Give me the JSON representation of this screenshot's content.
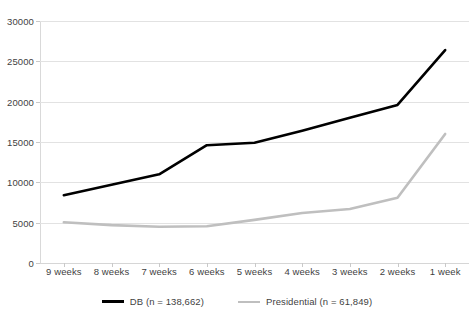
{
  "chart_data": {
    "type": "line",
    "title": "",
    "xlabel": "",
    "ylabel": "",
    "categories": [
      "9 weeks",
      "8 weeks",
      "7 weeks",
      "6 weeks",
      "5 weeks",
      "4 weeks",
      "3 weeks",
      "2 weeks",
      "1 week"
    ],
    "ylim": [
      0,
      30000
    ],
    "yticks": [
      0,
      5000,
      10000,
      15000,
      20000,
      25000,
      30000
    ],
    "ytick_labels": [
      "0",
      "5000",
      "10000",
      "15000",
      "20000",
      "25000",
      "30000"
    ],
    "grid": true,
    "legend_position": "bottom",
    "series": [
      {
        "name": "DB (n = 138,662)",
        "color": "#000000",
        "values": [
          8400,
          9700,
          11000,
          14600,
          14900,
          16400,
          18000,
          19600,
          26400
        ]
      },
      {
        "name": "Presidential (n = 61,849)",
        "color": "#bfbfbf",
        "values": [
          5050,
          4700,
          4500,
          4550,
          5350,
          6200,
          6700,
          8100,
          16000
        ]
      }
    ]
  },
  "legend": {
    "items": [
      {
        "label": "DB (n = 138,662)",
        "color": "#000000",
        "swatch": "thick-line-swatch"
      },
      {
        "label": "Presidential (n = 61,849)",
        "color": "#bfbfbf",
        "swatch": "thin-line-swatch"
      }
    ]
  }
}
